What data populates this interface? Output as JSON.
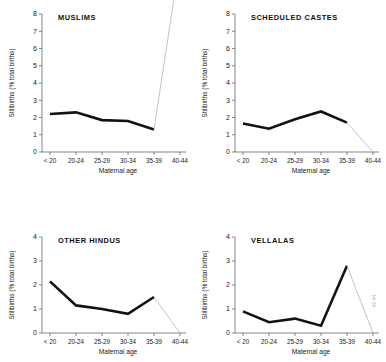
{
  "figure": {
    "axis_titles": {
      "x": "Maternal age",
      "y": "Stillbirths (% total births)"
    },
    "categories": [
      "< 20",
      "20-24",
      "25-29",
      "30-34",
      "35-39",
      "40-44"
    ],
    "faint_note": "40-44"
  },
  "chart_data": [
    {
      "type": "line",
      "title": "MUSLIMS",
      "xlabel": "Maternal age",
      "ylabel": "Stillbirths (% total births)",
      "categories": [
        "< 20",
        "20-24",
        "25-29",
        "30-34",
        "35-39",
        "40-44"
      ],
      "ylim": [
        0,
        8
      ],
      "yticks": [
        0,
        1,
        2,
        3,
        4,
        5,
        6,
        7,
        8
      ],
      "grid": false,
      "legend": "none",
      "series": [
        {
          "name": "Stillbirth rate (observed)",
          "style": "thick-black",
          "values": [
            2.2,
            2.3,
            1.85,
            1.8,
            1.3,
            null
          ]
        },
        {
          "name": "Extrapolation to 40-44",
          "style": "thin-grey",
          "values": [
            null,
            null,
            null,
            null,
            1.3,
            11.2
          ]
        }
      ]
    },
    {
      "type": "line",
      "title": "SCHEDULED CASTES",
      "xlabel": "Maternal age",
      "ylabel": "Stillbirths (% total births)",
      "categories": [
        "< 20",
        "20-24",
        "25-29",
        "30-34",
        "35-39",
        "40-44"
      ],
      "ylim": [
        0,
        8
      ],
      "yticks": [
        0,
        1,
        2,
        3,
        4,
        5,
        6,
        7,
        8
      ],
      "grid": false,
      "legend": "none",
      "series": [
        {
          "name": "Stillbirth rate (observed)",
          "style": "thick-black",
          "values": [
            1.65,
            1.35,
            1.9,
            2.35,
            1.7,
            null
          ]
        },
        {
          "name": "Extrapolation to 40-44",
          "style": "thin-grey",
          "values": [
            null,
            null,
            null,
            null,
            1.7,
            0.0
          ]
        }
      ]
    },
    {
      "type": "line",
      "title": "OTHER HINDUS",
      "xlabel": "Maternal age",
      "ylabel": "Stillbirths (% total births)",
      "categories": [
        "< 20",
        "20-24",
        "25-29",
        "30-34",
        "35-39",
        "40-44"
      ],
      "ylim": [
        0,
        4
      ],
      "yticks": [
        0,
        1,
        2,
        3,
        4
      ],
      "grid": false,
      "legend": "none",
      "series": [
        {
          "name": "Stillbirth rate (observed)",
          "style": "thick-black",
          "values": [
            2.15,
            1.15,
            1.0,
            0.8,
            1.5,
            null
          ]
        },
        {
          "name": "Extrapolation to 40-44",
          "style": "thin-grey",
          "values": [
            null,
            null,
            null,
            null,
            1.5,
            0.0
          ]
        }
      ]
    },
    {
      "type": "line",
      "title": "VELLALAS",
      "xlabel": "Maternal age",
      "ylabel": "Stillbirths (% total births)",
      "categories": [
        "< 20",
        "20-24",
        "25-29",
        "30-34",
        "35-39",
        "40-44"
      ],
      "ylim": [
        0,
        4
      ],
      "yticks": [
        0,
        1,
        2,
        3,
        4
      ],
      "grid": false,
      "legend": "none",
      "series": [
        {
          "name": "Stillbirth rate (observed)",
          "style": "thick-black",
          "values": [
            0.9,
            0.45,
            0.6,
            0.3,
            2.8,
            null
          ]
        },
        {
          "name": "Extrapolation to 40-44",
          "style": "thin-grey",
          "values": [
            null,
            null,
            null,
            null,
            2.8,
            0.0
          ]
        }
      ]
    }
  ]
}
